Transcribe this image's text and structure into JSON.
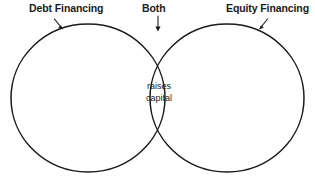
{
  "diagram": {
    "type": "venn",
    "title_visible": false,
    "background_color": "#ffffff",
    "stroke_color": "#1a1a1a",
    "text_color": "#1a1a1a",
    "sets": [
      {
        "id": "left",
        "label": "Debt Financing",
        "label_weight": "bold",
        "callout_icon": "arrow-down-right-icon",
        "contents": []
      },
      {
        "id": "right",
        "label": "Equity Financing",
        "label_weight": "bold",
        "callout_icon": "arrow-down-left-icon",
        "contents": []
      }
    ],
    "intersection": {
      "label": "Both",
      "label_weight": "bold",
      "callout_icon": "arrow-down-icon",
      "items": "raises\ncapital",
      "items_line1": "raises",
      "items_line2": "capital"
    }
  }
}
